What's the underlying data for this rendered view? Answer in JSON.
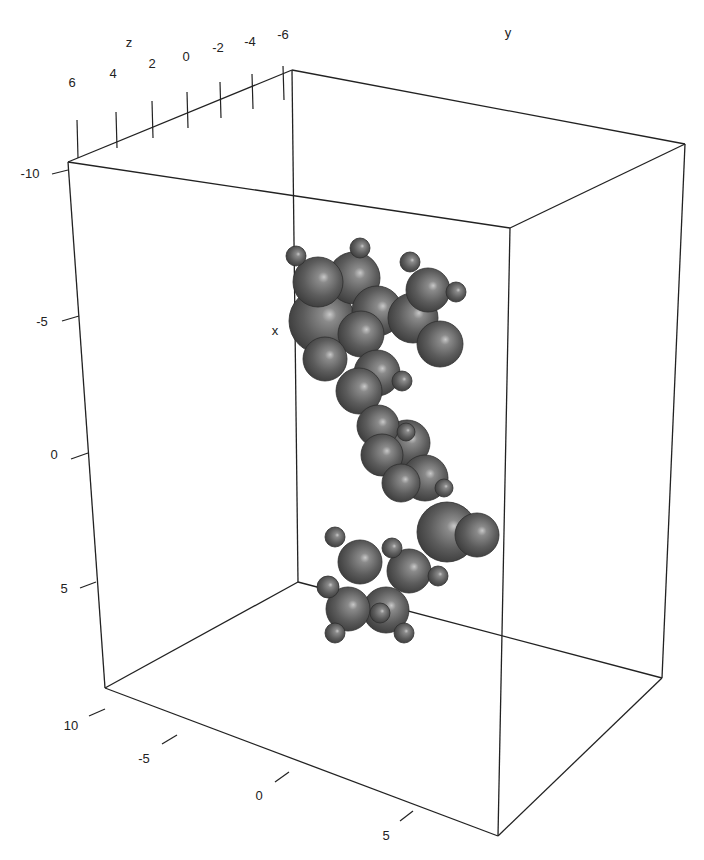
{
  "chart_data": {
    "type": "scatter3d",
    "title": "",
    "axes": {
      "x": {
        "label": "x",
        "ticks": [
          "-10",
          "-5",
          "0",
          "5",
          "10"
        ],
        "range": [
          -10,
          10
        ]
      },
      "y": {
        "label": "y",
        "ticks": [
          "-5",
          "0",
          "5"
        ],
        "range": [
          -8,
          8
        ]
      },
      "z": {
        "label": "z",
        "ticks": [
          "6",
          "4",
          "2",
          "0",
          "-2",
          "-4",
          "-6"
        ],
        "range": [
          -6,
          6
        ]
      }
    },
    "grid": false,
    "box": true,
    "sphere_color": "#5a5a5a",
    "atoms": [
      {
        "cx": 296,
        "cy": 256,
        "r": 10
      },
      {
        "cx": 318,
        "cy": 282,
        "r": 25
      },
      {
        "cx": 360,
        "cy": 248,
        "r": 10
      },
      {
        "cx": 354,
        "cy": 278,
        "r": 26
      },
      {
        "cx": 410,
        "cy": 262,
        "r": 10
      },
      {
        "cx": 428,
        "cy": 290,
        "r": 22
      },
      {
        "cx": 456,
        "cy": 292,
        "r": 10
      },
      {
        "cx": 322,
        "cy": 321,
        "r": 33
      },
      {
        "cx": 377,
        "cy": 311,
        "r": 25
      },
      {
        "cx": 413,
        "cy": 318,
        "r": 25
      },
      {
        "cx": 440,
        "cy": 344,
        "r": 23
      },
      {
        "cx": 361,
        "cy": 334,
        "r": 23
      },
      {
        "cx": 377,
        "cy": 373,
        "r": 23
      },
      {
        "cx": 402,
        "cy": 381,
        "r": 10
      },
      {
        "cx": 325,
        "cy": 359,
        "r": 22
      },
      {
        "cx": 359,
        "cy": 391,
        "r": 23
      },
      {
        "cx": 378,
        "cy": 426,
        "r": 21
      },
      {
        "cx": 382,
        "cy": 455,
        "r": 21
      },
      {
        "cx": 407,
        "cy": 443,
        "r": 23
      },
      {
        "cx": 406,
        "cy": 432,
        "r": 9
      },
      {
        "cx": 425,
        "cy": 478,
        "r": 23
      },
      {
        "cx": 444,
        "cy": 488,
        "r": 9
      },
      {
        "cx": 401,
        "cy": 483,
        "r": 19
      },
      {
        "cx": 447,
        "cy": 532,
        "r": 30
      },
      {
        "cx": 477,
        "cy": 535,
        "r": 22
      },
      {
        "cx": 335,
        "cy": 537,
        "r": 10
      },
      {
        "cx": 360,
        "cy": 562,
        "r": 22
      },
      {
        "cx": 392,
        "cy": 548,
        "r": 10
      },
      {
        "cx": 409,
        "cy": 571,
        "r": 22
      },
      {
        "cx": 438,
        "cy": 576,
        "r": 10
      },
      {
        "cx": 328,
        "cy": 587,
        "r": 11
      },
      {
        "cx": 348,
        "cy": 609,
        "r": 22
      },
      {
        "cx": 386,
        "cy": 610,
        "r": 23
      },
      {
        "cx": 380,
        "cy": 613,
        "r": 10
      },
      {
        "cx": 335,
        "cy": 633,
        "r": 10
      },
      {
        "cx": 404,
        "cy": 633,
        "r": 10
      }
    ]
  },
  "labels": {
    "x_axis": "x",
    "y_axis": "y",
    "z_axis": "z",
    "x_ticks": [
      "-10",
      "-5",
      "0",
      "5",
      "10"
    ],
    "y_ticks": [
      "-5",
      "0",
      "5"
    ],
    "z_ticks": [
      "6",
      "4",
      "2",
      "0",
      "-2",
      "-4",
      "-6"
    ]
  }
}
